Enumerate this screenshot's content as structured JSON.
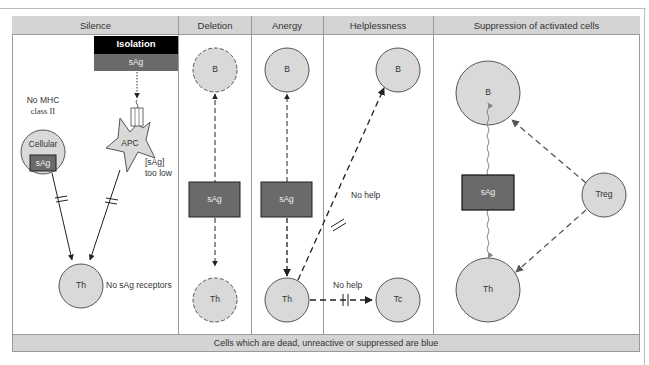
{
  "panels": [
    {
      "id": "silence",
      "title": "Silence"
    },
    {
      "id": "deletion",
      "title": "Deletion"
    },
    {
      "id": "anergy",
      "title": "Anergy"
    },
    {
      "id": "helplessness",
      "title": "Helplessness"
    },
    {
      "id": "suppression",
      "title": "Suppression of activated cells"
    }
  ],
  "silence": {
    "isolation_label": "Isolation",
    "sag_label": "sAg",
    "no_mhc_line1": "No MHC",
    "no_mhc_line2": "class II",
    "cellular_label": "Cellular",
    "cellular_sag": "sAg",
    "apc_label": "APC",
    "sag_low_line1": "[sAg]",
    "sag_low_line2": "too low",
    "th_label": "Th",
    "no_receptors": "No sAg receptors"
  },
  "deletion": {
    "b_label": "B",
    "sag_label": "sAg",
    "th_label": "Th"
  },
  "anergy": {
    "b_label": "B",
    "sag_label": "sAg",
    "th_label": "Th"
  },
  "helplessness": {
    "b_label": "B",
    "tc_label": "Tc",
    "no_help_b": "No help",
    "no_help_tc": "No help"
  },
  "suppression": {
    "b_label": "B",
    "sag_label": "sAg",
    "th_label": "Th",
    "treg_label": "Treg"
  },
  "footer": {
    "text": "Cells which are dead, unreactive or suppressed are blue"
  },
  "colors": {
    "cell_fill": "#d9d9d9",
    "sag_box": "#666666",
    "isolation_box": "#000000",
    "header_fill": "#d4d4d4",
    "border": "#9a9a9a"
  }
}
